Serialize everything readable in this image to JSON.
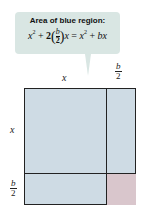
{
  "callout": {
    "title": "Area of blue region:",
    "formula_parts": {
      "x": "x",
      "exp": "2",
      "plus1": " + ",
      "coef": "2",
      "frac_num": "b",
      "frac_den": "2",
      "x2": "x",
      "equals": " = ",
      "x3": "x",
      "exp2": "2",
      "plus2": " + ",
      "bx": "bx"
    },
    "background_color": "#d9e6e3"
  },
  "labels": {
    "top_x": "x",
    "top_b_num": "b",
    "top_b_den": "2",
    "left_x": "x",
    "left_b_num": "b",
    "left_b_den": "2"
  },
  "colors": {
    "blue_region": "#cedbe4",
    "pink_region": "#d9c6cc",
    "outline": "#222222"
  }
}
